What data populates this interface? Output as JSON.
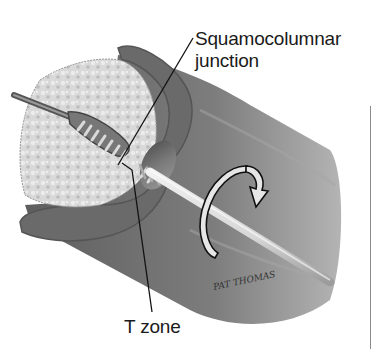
{
  "figure": {
    "labels": {
      "squamocolumnar_junction_line1": "Squamocolumnar",
      "squamocolumnar_junction_line2": "junction",
      "t_zone": "T zone"
    },
    "signature": "PAT THOMAS",
    "icons": {
      "rotation_arrow": "clockwise-rotation-arrow",
      "brush": "cytobrush"
    },
    "colors": {
      "background": "#ffffff",
      "tissue_dark": "#5a5a5a",
      "tissue_mid": "#8c8c8c",
      "tissue_light": "#c8c8c8",
      "leader_line": "#111111",
      "text": "#1a1a1a"
    }
  }
}
